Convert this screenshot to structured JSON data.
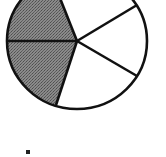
{
  "diagram": {
    "type": "fraction-circle",
    "total_parts": 5,
    "shaded_parts": 2,
    "colors": {
      "shaded": "#767676",
      "unshaded": "#ffffff",
      "stroke": "#111111",
      "background": "#ffffff"
    },
    "sectors": [
      {
        "id": "upper-left",
        "shaded": true
      },
      {
        "id": "lower-left",
        "shaded": true
      },
      {
        "id": "bottom",
        "shaded": false
      },
      {
        "id": "right",
        "shaded": false
      },
      {
        "id": "top-right",
        "shaded": false
      }
    ],
    "marker": {
      "shape": "square",
      "color": "#222222"
    }
  }
}
